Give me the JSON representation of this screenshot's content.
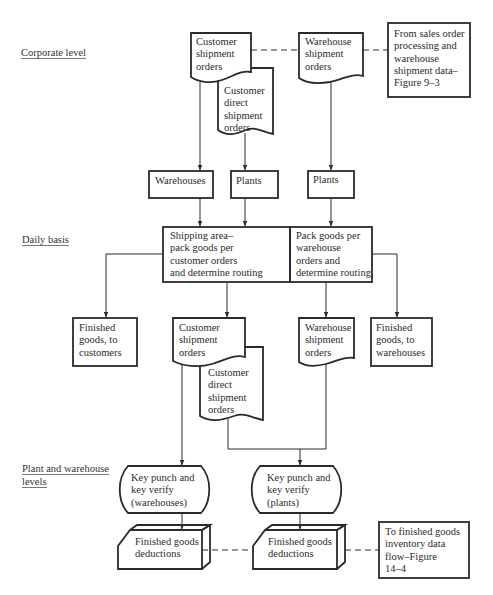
{
  "levels": [
    {
      "label": "Corporate level"
    },
    {
      "label": "Daily basis"
    },
    {
      "label_line1": "Plant and warehouse",
      "label_line2": "levels"
    }
  ],
  "nodes": {
    "corp_customer_orders": {
      "type": "document",
      "text": "Customer\nshipment\norders"
    },
    "corp_customer_direct_orders": {
      "type": "document",
      "text": "Customer\ndirect\nshipment\norders"
    },
    "corp_warehouse_orders": {
      "type": "document",
      "text": "Warehouse\nshipment\norders"
    },
    "source_note": {
      "type": "annotation",
      "text": "From sales order\nprocessing and\nwarehouse\nshipment data–\nFigure 9–3"
    },
    "warehouses": {
      "type": "process",
      "text": "Warehouses"
    },
    "plants_left": {
      "type": "process",
      "text": "Plants"
    },
    "plants_right": {
      "type": "process",
      "text": "Plants"
    },
    "shipping_area": {
      "type": "process",
      "text": "Shipping area–\npack goods per\ncustomer orders\nand determine routing"
    },
    "pack_goods": {
      "type": "process",
      "text": "Pack goods per\nwarehouse\norders and\ndetermine routing"
    },
    "finished_to_customers": {
      "type": "process",
      "text": "Finished\ngoods, to\ncustomers"
    },
    "daily_customer_orders": {
      "type": "document",
      "text": "Customer\nshipment\norders"
    },
    "daily_customer_direct_orders": {
      "type": "document",
      "text": "Customer\ndirect\nshipment\norders"
    },
    "daily_warehouse_orders": {
      "type": "document",
      "text": "Warehouse\nshipment\norders"
    },
    "finished_to_warehouses": {
      "type": "process",
      "text": "Finished\ngoods, to\nwarehouses"
    },
    "keypunch_warehouses": {
      "type": "manual-operation",
      "text": "Key punch and\nkey verify\n(warehouses)"
    },
    "keypunch_plants": {
      "type": "manual-operation",
      "text": "Key punch and\nkey verify\n(plants)"
    },
    "deductions_warehouses": {
      "type": "storage",
      "text": "Finished goods\ndeductions"
    },
    "deductions_plants": {
      "type": "storage",
      "text": "Finished goods\ndeductions"
    },
    "target_note": {
      "type": "annotation",
      "text": "To finished goods\ninventory data\nflow–Figure\n14–4"
    }
  },
  "colors": {
    "stroke": "#2a2a2a",
    "text": "#2b2b2b",
    "background": "#ffffff"
  }
}
